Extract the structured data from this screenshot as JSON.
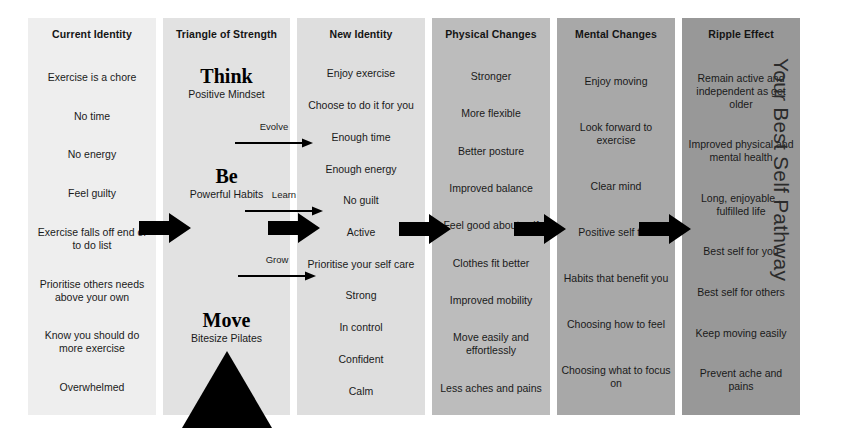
{
  "diagram": {
    "pathway_label": "Your Best Self Pathway",
    "columns": [
      {
        "id": "current-identity",
        "header": "Current Identity",
        "bg": "#eeeeee",
        "items": [
          "Exercise is a chore",
          "No time",
          "No energy",
          "Feel guilty",
          "Exercise falls off end of to do list",
          "Prioritise others needs above your own",
          "Know you should do more exercise",
          "Overwhelmed"
        ]
      },
      {
        "id": "triangle-of-strength",
        "header": "Triangle of Strength",
        "bg": "#e2e2e2",
        "blocks": [
          {
            "word": "Think",
            "sub": "Positive Mindset"
          },
          {
            "word": "Be",
            "sub": "Powerful Habits"
          },
          {
            "word": "Move",
            "sub": "Bitesize Pilates"
          }
        ],
        "shape": "triangle"
      },
      {
        "id": "new-identity",
        "header": "New Identity",
        "bg": "#dedede",
        "items": [
          "Enjoy exercise",
          "Choose to do it for you",
          "Enough time",
          "Enough energy",
          "No guilt",
          "Active",
          "Prioritise your self care",
          "Strong",
          "In control",
          "Confident",
          "Calm"
        ]
      },
      {
        "id": "physical-changes",
        "header": "Physical Changes",
        "bg": "#bcbcbc",
        "items": [
          "Stronger",
          "More flexible",
          "Better posture",
          "Improved balance",
          "Feel good about self",
          "Clothes fit better",
          "Improved mobility",
          "Move  easily and effortlessly",
          "Less aches and pains"
        ]
      },
      {
        "id": "mental-changes",
        "header": "Mental Changes",
        "bg": "#a8a8a8",
        "items": [
          "Enjoy moving",
          "Look forward to exercise",
          "Clear mind",
          "Positive self talk",
          "Habits that benefit you",
          "Choosing how to feel",
          "Choosing what to focus on"
        ]
      },
      {
        "id": "ripple-effect",
        "header": "Ripple Effect",
        "bg": "#989898",
        "items": [
          "Remain active and independent as get older",
          "Improved physical and mental health",
          "Long, enjoyable , fulfilled life",
          "Best self for you",
          "Best self for others",
          "Keep moving easily",
          "Prevent ache and pains"
        ]
      }
    ],
    "flow_arrows": [
      {
        "id": "arrow-current-to-triangle"
      },
      {
        "id": "arrow-triangle-to-new"
      },
      {
        "id": "arrow-new-to-physical"
      },
      {
        "id": "arrow-physical-to-mental"
      },
      {
        "id": "arrow-mental-to-ripple"
      }
    ],
    "labelled_arrows": [
      {
        "id": "evolve-arrow",
        "label": "Evolve"
      },
      {
        "id": "learn-arrow",
        "label": "Learn"
      },
      {
        "id": "grow-arrow",
        "label": "Grow"
      }
    ]
  }
}
